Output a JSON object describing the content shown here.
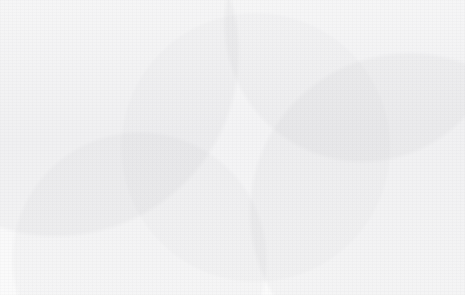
{
  "chart_data": {
    "type": "bar",
    "title": "",
    "xlabel": "",
    "ylabel": "",
    "ylim": [
      0,
      80
    ],
    "ytick_labels": [
      "0%",
      "10%",
      "20%",
      "30%",
      "40%",
      "50%",
      "60%",
      "70%",
      "80%"
    ],
    "ytick_values": [
      0,
      10,
      20,
      30,
      40,
      50,
      60,
      70,
      80
    ],
    "grid": true,
    "legend_position": "bottom",
    "categories": [
      "2010",
      "2011",
      "2012",
      "2013",
      "2014",
      "2015",
      "2016",
      "2017",
      "2018",
      "2019"
    ],
    "series": [
      {
        "name": "Share of trade affected by RoW measures toward the LatAm (time t-1)",
        "type": "bar",
        "color": "#5f5f5f",
        "values": [
          6,
          10,
          11.5,
          16,
          25,
          29.5,
          31,
          34.5,
          33,
          34.5
        ]
      },
      {
        "name": "Share of trade affected by Latin America's measure toward the RoW (time t)",
        "type": "bar",
        "color": "#a8a8a8",
        "values": [
          38.5,
          41,
          64.5,
          72.5,
          74,
          74,
          60,
          60,
          60.5,
          60.5
        ]
      },
      {
        "name": "Linear (Share of trade affected by RoW measures toward the LatAm (time t-1))",
        "type": "line",
        "style": "dotted",
        "color": "#6e6e6e",
        "values": [
          7.3,
          10.6,
          13.9,
          17.2,
          20.5,
          23.8,
          27.1,
          30.4,
          33.7,
          37.0
        ]
      },
      {
        "name": "Linear (Share of trade affected by Latin America's measure toward the RoW (time t))",
        "type": "line",
        "style": "dotted",
        "color": "#b0b0b0",
        "values": [
          52.4,
          54.2,
          56.0,
          57.8,
          59.6,
          61.4,
          63.2,
          65.0,
          66.8,
          68.6
        ]
      }
    ]
  },
  "legend": {
    "items": [
      {
        "label": "Share of trade affected by RoW measures toward the LatAm (time t-1)",
        "marker": "bar-dark"
      },
      {
        "label": "Share of trade affected by Latin America's measure toward the RoW (time t)",
        "marker": "bar-light"
      },
      {
        "label": "Linear (Share of trade affected by RoW measures toward the LatAm (time t-1))",
        "marker": "dotted-dark"
      },
      {
        "label": "Linear (Share of trade affected by Latin America's measure toward the RoW (time t))",
        "marker": "dotted-light"
      }
    ]
  },
  "colors": {
    "bar_dark": "#5f5f5f",
    "bar_light": "#a8a8a8",
    "trend_dark": "#6e6e6e",
    "trend_light": "#b0b0b0",
    "gridline": "#d6d6d6",
    "frame": "#d9d9d9",
    "text": "#4d4d4d"
  }
}
